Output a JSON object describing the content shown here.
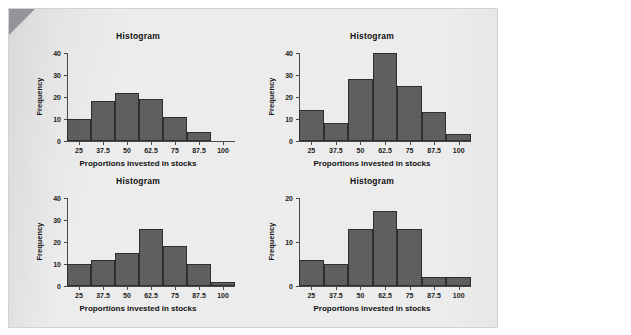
{
  "page": {
    "background_color": "#ffffff",
    "panel_color": "#ececec",
    "bar_color": "#5b5b5b",
    "bar_outline_color": "#2e2e2e",
    "axis_color": "#4a4a4a"
  },
  "chart_data": [
    {
      "id": "histogram-top-left",
      "type": "bar",
      "title": "Histogram",
      "xlabel": "Proportions invested in stocks",
      "ylabel": "Frequency",
      "xticks": [
        "25",
        "37.5",
        "50",
        "62.5",
        "75",
        "87.5",
        "100"
      ],
      "xtick_values": [
        25,
        37.5,
        50,
        62.5,
        75,
        87.5,
        100
      ],
      "yticks": [
        "0",
        "10",
        "20",
        "30",
        "40"
      ],
      "ytick_values": [
        0,
        10,
        20,
        30,
        40
      ],
      "ylim": [
        0,
        40
      ],
      "xlim": [
        18.75,
        106.25
      ],
      "bin_width": 12.5,
      "bin_centers": [
        25,
        37.5,
        50,
        62.5,
        75,
        87.5
      ],
      "values": [
        10,
        18,
        22,
        19,
        11,
        4
      ],
      "grid": false,
      "legend": false
    },
    {
      "id": "histogram-top-right",
      "type": "bar",
      "title": "Histogram",
      "xlabel": "Proportions invested in stocks",
      "ylabel": "Frequency",
      "xticks": [
        "25",
        "37.5",
        "50",
        "62.5",
        "75",
        "87.5",
        "100"
      ],
      "xtick_values": [
        25,
        37.5,
        50,
        62.5,
        75,
        87.5,
        100
      ],
      "yticks": [
        "0",
        "10",
        "20",
        "30",
        "40"
      ],
      "ytick_values": [
        0,
        10,
        20,
        30,
        40
      ],
      "ylim": [
        0,
        40
      ],
      "xlim": [
        18.75,
        106.25
      ],
      "bin_width": 12.5,
      "bin_centers": [
        25,
        37.5,
        50,
        62.5,
        75,
        87.5,
        100
      ],
      "values": [
        14,
        8,
        28,
        40,
        25,
        13,
        3
      ],
      "grid": false,
      "legend": false
    },
    {
      "id": "histogram-bottom-left",
      "type": "bar",
      "title": "Histogram",
      "xlabel": "Proportions invested in stocks",
      "ylabel": "Frequency",
      "xticks": [
        "25",
        "37.5",
        "50",
        "62.5",
        "75",
        "87.5",
        "100"
      ],
      "xtick_values": [
        25,
        37.5,
        50,
        62.5,
        75,
        87.5,
        100
      ],
      "yticks": [
        "0",
        "10",
        "20",
        "30",
        "40"
      ],
      "ytick_values": [
        0,
        10,
        20,
        30,
        40
      ],
      "ylim": [
        0,
        40
      ],
      "xlim": [
        18.75,
        106.25
      ],
      "bin_width": 12.5,
      "bin_centers": [
        25,
        37.5,
        50,
        62.5,
        75,
        87.5,
        100
      ],
      "values": [
        10,
        12,
        15,
        26,
        18,
        10,
        2
      ],
      "grid": false,
      "legend": false
    },
    {
      "id": "histogram-bottom-right",
      "type": "bar",
      "title": "Histogram",
      "xlabel": "Proportions invested in stocks",
      "ylabel": "Frequency",
      "xticks": [
        "25",
        "37.5",
        "50",
        "62.5",
        "75",
        "87.5",
        "100"
      ],
      "xtick_values": [
        25,
        37.5,
        50,
        62.5,
        75,
        87.5,
        100
      ],
      "yticks": [
        "0",
        "10",
        "20"
      ],
      "ytick_values": [
        0,
        10,
        20
      ],
      "ylim": [
        0,
        20
      ],
      "xlim": [
        18.75,
        106.25
      ],
      "bin_width": 12.5,
      "bin_centers": [
        25,
        37.5,
        50,
        62.5,
        75,
        87.5,
        100
      ],
      "values": [
        6,
        5,
        13,
        17,
        13,
        2,
        2
      ],
      "grid": false,
      "legend": false
    }
  ]
}
